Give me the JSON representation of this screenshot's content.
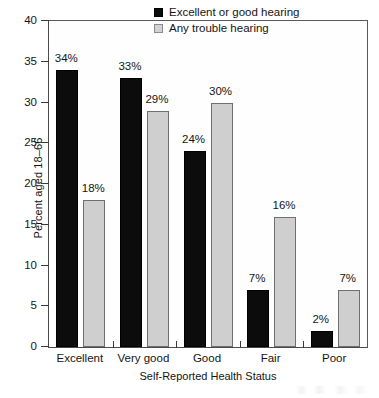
{
  "chart_data": {
    "type": "bar",
    "title": "",
    "categories": [
      "Excellent",
      "Very good",
      "Good",
      "Fair",
      "Poor"
    ],
    "series": [
      {
        "name": "Excellent or good hearing",
        "color": "#0c0c0c",
        "values": [
          34,
          33,
          24,
          7,
          2
        ],
        "labels": [
          "34%",
          "33%",
          "24%",
          "7%",
          "2%"
        ]
      },
      {
        "name": "Any trouble hearing",
        "color": "#cfcfcf",
        "values": [
          18,
          29,
          30,
          16,
          7
        ],
        "labels": [
          "18%",
          "29%",
          "30%",
          "16%",
          "7%"
        ]
      }
    ],
    "xlabel": "Self-Reported Health Status",
    "ylabel": "Percent aged 18–66",
    "ylim": [
      0,
      40
    ],
    "ytick_values": [
      0,
      5,
      10,
      15,
      20,
      25,
      30,
      35,
      40
    ],
    "ytick_labels": [
      "0",
      "5",
      "10",
      "15",
      "20",
      "25",
      "30",
      "35",
      "40"
    ],
    "grid": false,
    "legend_position": "top-right",
    "bar_value_labels": true
  },
  "legend": {
    "entries": [
      {
        "label": "Excellent or good hearing",
        "swatch": "black-square-icon"
      },
      {
        "label": "Any trouble hearing",
        "swatch": "gray-square-icon"
      }
    ]
  }
}
